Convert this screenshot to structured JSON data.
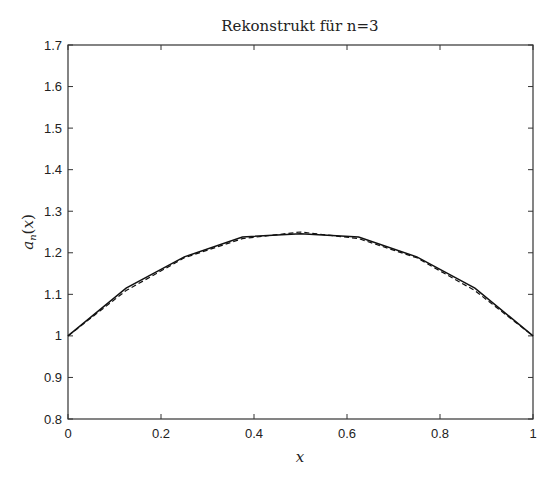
{
  "chart_data": {
    "type": "line",
    "title": "Rekonstrukt für n=3",
    "xlabel": "x",
    "ylabel": "a_n(x)",
    "xlim": [
      0,
      1
    ],
    "ylim": [
      0.8,
      1.7
    ],
    "xticks": [
      0,
      0.2,
      0.4,
      0.6,
      0.8,
      1
    ],
    "xtick_labels": [
      "0",
      "0.2",
      "0.4",
      "0.6",
      "0.8",
      "1"
    ],
    "yticks": [
      0.8,
      0.9,
      1.0,
      1.1,
      1.2,
      1.3,
      1.4,
      1.5,
      1.6,
      1.7
    ],
    "ytick_labels": [
      "0.8",
      "0.9",
      "1",
      "1.1",
      "1.2",
      "1.3",
      "1.4",
      "1.5",
      "1.6",
      "1.7"
    ],
    "grid": false,
    "legend": null,
    "x": [
      0,
      0.125,
      0.25,
      0.375,
      0.5,
      0.625,
      0.75,
      0.875,
      1
    ],
    "series": [
      {
        "name": "reconstruction (n=3)",
        "style": "solid",
        "color": "#111111",
        "values": [
          1.0,
          1.115,
          1.19,
          1.238,
          1.246,
          1.238,
          1.19,
          1.115,
          1.0
        ]
      },
      {
        "name": "exact",
        "style": "dashed",
        "color": "#111111",
        "values": [
          1.0,
          1.109,
          1.188,
          1.234,
          1.25,
          1.234,
          1.188,
          1.109,
          1.0
        ]
      }
    ]
  },
  "colors": {
    "axis": "#333333",
    "line": "#111111",
    "background": "#ffffff"
  }
}
